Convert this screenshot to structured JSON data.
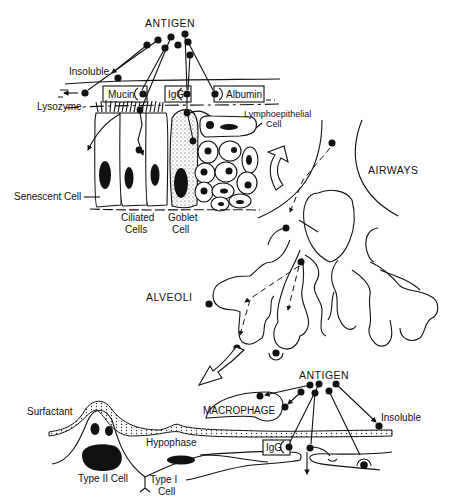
{
  "figure": {
    "panels": {
      "airway_epithelium": {
        "antigen_label": "ANTIGEN",
        "labels": {
          "insoluble": "Insoluble",
          "lysozyme": "Lysozyme",
          "mucin": "Mucin",
          "igg": "IgG",
          "albumin": "Albumin",
          "lymphoepithelial_line1": "Lymphoepithelial",
          "lymphoepithelial_line2": "Cell",
          "senescent": "Senescent Cell",
          "ciliated_line1": "Ciliated",
          "ciliated_line2": "Cells",
          "goblet_line1": "Goblet",
          "goblet_line2": "Cell"
        }
      },
      "lung_tree": {
        "airways_label": "AIRWAYS",
        "alveoli_label": "ALVEOLI"
      },
      "alveolar_wall": {
        "antigen_label": "ANTIGEN",
        "labels": {
          "surfactant": "Surfactant",
          "macrophage": "MACROPHAGE",
          "insoluble": "Insoluble",
          "hypophase": "Hypophase",
          "igg": "IgG",
          "type2_cell": "Type II Cell",
          "type1_line1": "Type I",
          "type1_line2": "Cell"
        }
      }
    },
    "colors": {
      "ink": "#111111",
      "background": "#ffffff"
    }
  }
}
